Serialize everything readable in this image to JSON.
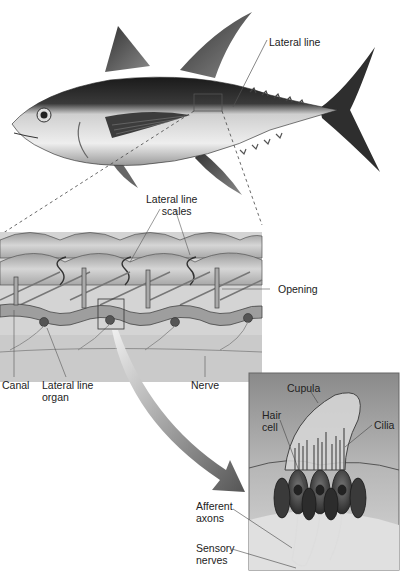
{
  "diagram": {
    "colors": {
      "fish_dark": "#1e1e1e",
      "fish_light": "#dcdcdc",
      "scale_fill": "#b8b8b8",
      "tissue_fill": "#cfcfcf",
      "arrow_start": "#e4e4e4",
      "arrow_end": "#5a5a5a",
      "inset_bg": "#9a9a9a",
      "label_text": "#222222",
      "leader_line": "#555555"
    },
    "labels": {
      "lateral_line": "Lateral line",
      "lateral_line_scales_1": "Lateral line",
      "lateral_line_scales_2": "scales",
      "opening": "Opening",
      "canal": "Canal",
      "lateral_line_organ_1": "Lateral line",
      "lateral_line_organ_2": "organ",
      "nerve": "Nerve",
      "cupula": "Cupula",
      "hair_cell_1": "Hair",
      "hair_cell_2": "cell",
      "cilia": "Cilia",
      "afferent_axons_1": "Afferent",
      "afferent_axons_2": "axons",
      "sensory_nerves_1": "Sensory",
      "sensory_nerves_2": "nerves"
    },
    "panels": [
      {
        "name": "whole-fish",
        "desc": "Tuna with lateral line highlighted"
      },
      {
        "name": "scale-section",
        "desc": "Cross-section of lateral line scales and canal"
      },
      {
        "name": "neuromast-inset",
        "desc": "Lateral line organ with cupula and hair cells"
      }
    ]
  }
}
